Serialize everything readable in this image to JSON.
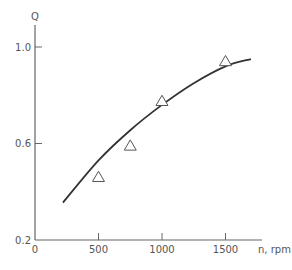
{
  "chart_data": {
    "type": "line",
    "title": "",
    "xlabel": "n, rpm",
    "ylabel": "Q",
    "xlim": [
      0,
      1800
    ],
    "ylim": [
      0.2,
      1.1
    ],
    "grid": false,
    "legend": null,
    "x_ticks": [
      {
        "value": 0,
        "label": "0"
      },
      {
        "value": 500,
        "label": "500"
      },
      {
        "value": 1000,
        "label": "1000"
      },
      {
        "value": 1500,
        "label": "1500"
      }
    ],
    "y_ticks": [
      {
        "value": 0.2,
        "label": "0.2"
      },
      {
        "value": 0.6,
        "label": "0.6"
      },
      {
        "value": 1.0,
        "label": "1.0"
      }
    ],
    "series": [
      {
        "name": "fitted curve",
        "kind": "line",
        "x": [
          220,
          500,
          750,
          1000,
          1250,
          1500,
          1700
        ],
        "values": [
          0.355,
          0.53,
          0.655,
          0.76,
          0.85,
          0.92,
          0.95
        ]
      },
      {
        "name": "measured",
        "kind": "scatter",
        "marker": "triangle-open",
        "x": [
          500,
          750,
          1000,
          1500
        ],
        "values": [
          0.46,
          0.59,
          0.775,
          0.94
        ]
      }
    ]
  },
  "colors": {
    "axis": "#666666",
    "curve": "#333333",
    "marker": "#555555",
    "text": "#555555"
  }
}
